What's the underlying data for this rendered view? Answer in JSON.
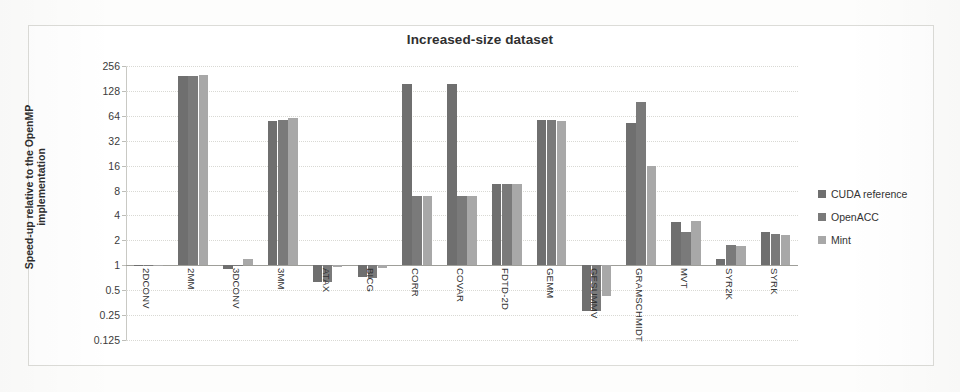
{
  "chart_data": {
    "type": "bar",
    "title": "Increased-size dataset",
    "xlabel": "",
    "ylabel": "Speed-up relative to the OpenMP implementation",
    "ylabel_line1": "Speed-up relative to the OpenMP",
    "ylabel_line2": "implementation",
    "yscale": "log2",
    "ylim": [
      0.125,
      256
    ],
    "yticks": [
      256,
      128,
      64,
      32,
      16,
      8,
      4,
      2,
      1,
      0.5,
      0.25,
      0.125
    ],
    "ytick_labels": [
      "256",
      "128",
      "64",
      "32",
      "16",
      "8",
      "4",
      "2",
      "1",
      "0.5",
      "0.25",
      "0.125"
    ],
    "baseline": 1,
    "grid": true,
    "legend_position": "right",
    "categories": [
      "2DCONV",
      "2MM",
      "3DCONV",
      "3MM",
      "ATAX",
      "BICG",
      "CORR",
      "COVAR",
      "FDTD-2D",
      "GEMM",
      "GESUMMV",
      "GRAMSCHMIDT",
      "MVT",
      "SYR2K",
      "SYRK"
    ],
    "series": [
      {
        "name": "CUDA reference",
        "color": "#6f6f6f",
        "values": [
          1.02,
          196,
          0.9,
          55,
          0.62,
          0.72,
          154,
          154,
          9.5,
          57,
          0.28,
          52,
          3.3,
          1.2,
          2.5
        ]
      },
      {
        "name": "OpenACC",
        "color": "#7a7a7a",
        "values": [
          1.01,
          196,
          1.0,
          57,
          0.62,
          0.7,
          6.9,
          6.8,
          9.7,
          57,
          0.28,
          95,
          2.5,
          1.75,
          2.4
        ]
      },
      {
        "name": "Mint",
        "color": "#a8a8a8",
        "values": [
          1.0,
          197,
          1.2,
          60,
          0.95,
          0.92,
          6.9,
          6.8,
          9.7,
          56,
          0.42,
          16,
          3.4,
          1.7,
          2.3
        ]
      }
    ]
  },
  "legend": {
    "items": [
      {
        "label": "CUDA reference",
        "color": "#6f6f6f"
      },
      {
        "label": "OpenACC",
        "color": "#7a7a7a"
      },
      {
        "label": "Mint",
        "color": "#a8a8a8"
      }
    ]
  }
}
